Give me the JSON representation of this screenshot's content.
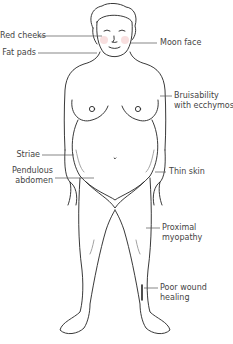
{
  "diagram": {
    "labels_left": [
      {
        "id": "red-cheeks",
        "text": "Red cheeks"
      },
      {
        "id": "fat-pads",
        "text": "Fat pads"
      },
      {
        "id": "striae",
        "text": "Striae"
      },
      {
        "id": "pendulous-abdomen",
        "text": "Pendulous\nabdomen"
      }
    ],
    "labels_right": [
      {
        "id": "moon-face",
        "text": "Moon face"
      },
      {
        "id": "bruisability",
        "text": "Bruisability\nwith ecchymoses"
      },
      {
        "id": "thin-skin",
        "text": "Thin skin"
      },
      {
        "id": "proximal-myopathy",
        "text": "Proximal\nmyopathy"
      },
      {
        "id": "poor-wound-healing",
        "text": "Poor wound\nhealing"
      }
    ],
    "colors": {
      "line": "#222222",
      "leader": "#555555",
      "text": "#444444",
      "cheek": "#f4c9c9"
    }
  }
}
